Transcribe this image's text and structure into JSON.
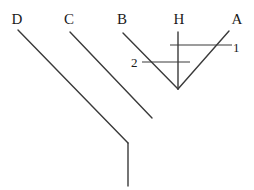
{
  "figure": {
    "type": "cladogram",
    "background_color": "#ffffff",
    "line_color": "#3a3a3a",
    "text_color": "#1a1a1a",
    "width": 254,
    "height": 190
  },
  "taxa": [
    {
      "id": "D",
      "label": "D",
      "x": 17,
      "y": 24
    },
    {
      "id": "C",
      "label": "C",
      "x": 69,
      "y": 24
    },
    {
      "id": "B",
      "label": "B",
      "x": 122,
      "y": 24
    },
    {
      "id": "H",
      "label": "H",
      "x": 179,
      "y": 24
    },
    {
      "id": "A",
      "label": "A",
      "x": 237,
      "y": 24
    }
  ],
  "node_labels": [
    {
      "id": "1",
      "label": "1",
      "x": 233,
      "y": 52
    },
    {
      "id": "2",
      "label": "2",
      "x": 131,
      "y": 67
    }
  ],
  "branches": [
    {
      "name": "branch-D",
      "x1": 18,
      "y1": 30,
      "x2": 128,
      "y2": 143
    },
    {
      "name": "branch-C",
      "x1": 70,
      "y1": 32,
      "x2": 152,
      "y2": 118
    },
    {
      "name": "branch-B",
      "x1": 123,
      "y1": 33,
      "x2": 178,
      "y2": 89
    },
    {
      "name": "branch-H",
      "x1": 178,
      "y1": 32,
      "x2": 178,
      "y2": 89
    },
    {
      "name": "branch-A",
      "x1": 229,
      "y1": 31,
      "x2": 178,
      "y2": 89
    },
    {
      "name": "branch-root",
      "x1": 128,
      "y1": 143,
      "x2": 128,
      "y2": 186
    }
  ],
  "character_bars": [
    {
      "name": "bar-1",
      "x1": 170,
      "y1": 45,
      "x2": 232,
      "y2": 45,
      "label": "1"
    },
    {
      "name": "bar-2",
      "x1": 142,
      "y1": 62,
      "x2": 190,
      "y2": 62,
      "label": "2"
    }
  ]
}
